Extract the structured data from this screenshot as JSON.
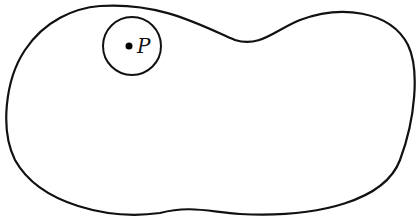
{
  "diagram": {
    "region": {
      "stroke": "#111111",
      "fill": "none"
    },
    "neighborhood": {
      "center": [
        132,
        46
      ],
      "radius": 29,
      "stroke": "#111111"
    },
    "point": {
      "label": "P",
      "position": [
        129,
        46
      ],
      "color": "#000000"
    }
  }
}
